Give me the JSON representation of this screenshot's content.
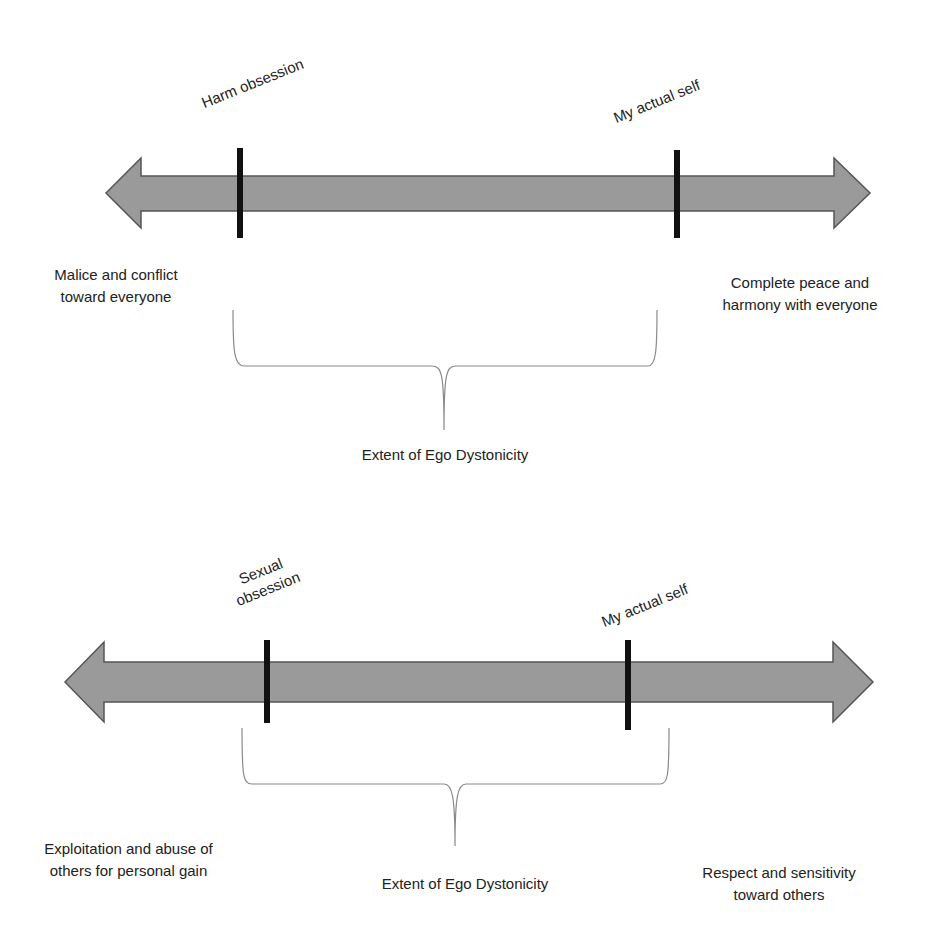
{
  "colors": {
    "arrow_fill": "#9a9a9a",
    "arrow_stroke": "#555555",
    "marker": "#111111",
    "brace": "#8a8a8a",
    "text": "#222222"
  },
  "diagrams": [
    {
      "markers": [
        {
          "label": "Harm obsession",
          "position": "left"
        },
        {
          "label": "My actual self",
          "position": "right"
        }
      ],
      "left_pole": [
        "Malice and conflict",
        "toward everyone"
      ],
      "right_pole": [
        "Complete peace and",
        "harmony with everyone"
      ],
      "brace_label": "Extent of Ego Dystonicity"
    },
    {
      "markers": [
        {
          "label_lines": [
            "Sexual",
            "obsession"
          ],
          "position": "left"
        },
        {
          "label": "My actual self",
          "position": "right"
        }
      ],
      "left_pole": [
        "Exploitation and abuse of",
        "others for personal gain"
      ],
      "right_pole": [
        "Respect and sensitivity",
        "toward others"
      ],
      "brace_label": "Extent of Ego Dystonicity"
    }
  ]
}
